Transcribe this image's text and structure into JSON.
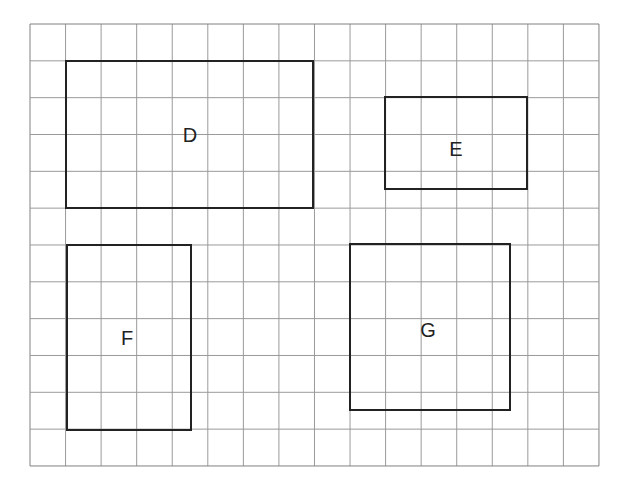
{
  "diagram": {
    "type": "grid-rectangles",
    "grid": {
      "origin_x": 30,
      "origin_y": 24,
      "cols": 16,
      "rows": 12,
      "cell_w": 35.56,
      "cell_h": 36.83,
      "line_color": "#9a9a9a",
      "border_color": "#808080"
    },
    "rect_stroke": "#222222",
    "rectangles": [
      {
        "id": "D",
        "label": "D",
        "x": 66,
        "y": 61,
        "w": 247,
        "h": 147,
        "label_x": 190,
        "label_y": 142
      },
      {
        "id": "E",
        "label": "E",
        "x": 385,
        "y": 97,
        "w": 142,
        "h": 92,
        "label_x": 456,
        "label_y": 156
      },
      {
        "id": "F",
        "label": "F",
        "x": 67,
        "y": 245,
        "w": 124,
        "h": 185,
        "label_x": 127,
        "label_y": 345
      },
      {
        "id": "G",
        "label": "G",
        "x": 350,
        "y": 244,
        "w": 160,
        "h": 166,
        "label_x": 428,
        "label_y": 337
      }
    ]
  }
}
